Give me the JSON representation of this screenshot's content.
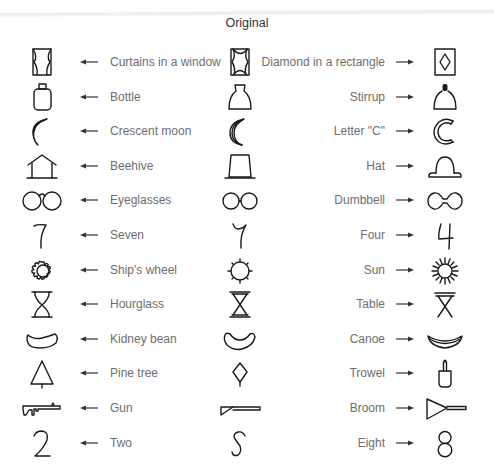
{
  "title": "Original",
  "rows": [
    {
      "left_glyph": "curtains-in-window-icon",
      "left_label": "Curtains in a window",
      "middle_glyph": "curtains-diamond-ambiguous-icon",
      "middle_label": "Diamond in a rectangle",
      "right_glyph": "diamond-in-rectangle-icon"
    },
    {
      "left_glyph": "bottle-icon",
      "left_label": "Bottle",
      "middle_glyph": "bottle-stirrup-ambiguous-icon",
      "middle_label": "Stirrup",
      "right_glyph": "stirrup-icon"
    },
    {
      "left_glyph": "crescent-moon-icon",
      "left_label": "Crescent moon",
      "middle_glyph": "moon-letter-c-ambiguous-icon",
      "middle_label": "Letter \"C\"",
      "right_glyph": "letter-c-icon"
    },
    {
      "left_glyph": "beehive-icon",
      "left_label": "Beehive",
      "middle_glyph": "beehive-hat-ambiguous-icon",
      "middle_label": "Hat",
      "right_glyph": "hat-icon"
    },
    {
      "left_glyph": "eyeglasses-icon",
      "left_label": "Eyeglasses",
      "middle_glyph": "eyeglasses-dumbbell-ambiguous-icon",
      "middle_label": "Dumbbell",
      "right_glyph": "dumbbell-icon"
    },
    {
      "left_glyph": "seven-icon",
      "left_label": "Seven",
      "middle_glyph": "seven-four-ambiguous-icon",
      "middle_label": "Four",
      "right_glyph": "four-icon"
    },
    {
      "left_glyph": "ships-wheel-icon",
      "left_label": "Ship's wheel",
      "middle_glyph": "wheel-sun-ambiguous-icon",
      "middle_label": "Sun",
      "right_glyph": "sun-icon"
    },
    {
      "left_glyph": "hourglass-icon",
      "left_label": "Hourglass",
      "middle_glyph": "hourglass-table-ambiguous-icon",
      "middle_label": "Table",
      "right_glyph": "table-icon"
    },
    {
      "left_glyph": "kidney-bean-icon",
      "left_label": "Kidney bean",
      "middle_glyph": "bean-canoe-ambiguous-icon",
      "middle_label": "Canoe",
      "right_glyph": "canoe-icon"
    },
    {
      "left_glyph": "pine-tree-icon",
      "left_label": "Pine tree",
      "middle_glyph": "tree-trowel-ambiguous-icon",
      "middle_label": "Trowel",
      "right_glyph": "trowel-icon"
    },
    {
      "left_glyph": "gun-icon",
      "left_label": "Gun",
      "middle_glyph": "gun-broom-ambiguous-icon",
      "middle_label": "Broom",
      "right_glyph": "broom-icon"
    },
    {
      "left_glyph": "two-icon",
      "left_label": "Two",
      "middle_glyph": "two-eight-ambiguous-icon",
      "middle_label": "Eight",
      "right_glyph": "eight-icon"
    }
  ],
  "arrows": {
    "left": "arrow-left-icon",
    "right": "arrow-right-icon"
  },
  "colors": {
    "glyph": "#1a1a1a",
    "label": "#6e6e6e",
    "title": "#333333",
    "background": "#ffffff"
  }
}
